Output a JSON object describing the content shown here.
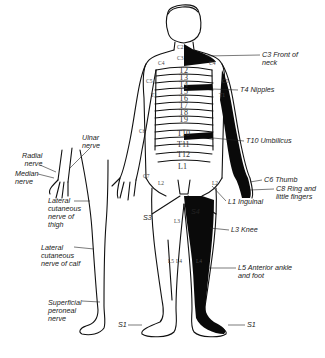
{
  "diagram": {
    "callouts_right": [
      {
        "id": "c3",
        "text": "C3 Front of\nneck",
        "x": 262,
        "y": 52
      },
      {
        "id": "t4",
        "text": "T4 Nipples",
        "x": 240,
        "y": 87
      },
      {
        "id": "t10",
        "text": "T10 Umbilicus",
        "x": 246,
        "y": 138
      },
      {
        "id": "c6",
        "text": "C6 Thumb",
        "x": 264,
        "y": 177
      },
      {
        "id": "c8",
        "text": "C8 Ring and\nlittle fingers",
        "x": 276,
        "y": 186
      },
      {
        "id": "l1",
        "text": "L1 Inguinal",
        "x": 228,
        "y": 199
      },
      {
        "id": "l3",
        "text": "L3 Knee",
        "x": 231,
        "y": 227
      },
      {
        "id": "l5",
        "text": "L5 Anterior ankle\nand foot",
        "x": 238,
        "y": 265
      },
      {
        "id": "s1r",
        "text": "S1",
        "x": 247,
        "y": 322
      }
    ],
    "callouts_left": [
      {
        "id": "radial",
        "text": "Radial\nnerve",
        "x": 22,
        "y": 154
      },
      {
        "id": "median",
        "text": "Median\nnerve",
        "x": 16,
        "y": 171
      },
      {
        "id": "ulnar",
        "text": "Ulnar\nnerve",
        "x": 82,
        "y": 136
      },
      {
        "id": "lcnt",
        "text": "Lateral\ncutaneous\nnerve of\nthigh",
        "x": 48,
        "y": 198
      },
      {
        "id": "lcnc",
        "text": "Lateral\ncutaneous\nnerve of calf",
        "x": 40,
        "y": 245
      },
      {
        "id": "spn",
        "text": "Superficial\nperoneal\nnerve",
        "x": 48,
        "y": 300
      },
      {
        "id": "s1l",
        "text": "S1",
        "x": 120,
        "y": 322
      },
      {
        "id": "s3",
        "text": "S3",
        "x": 143,
        "y": 216
      },
      {
        "id": "s4",
        "text": "S4",
        "x": 190,
        "y": 210
      }
    ],
    "thoracic_levels": [
      "T2",
      "T3",
      "T4",
      "T5",
      "T6",
      "T7",
      "T8",
      "T9",
      "T10",
      "T11",
      "T12",
      "L1"
    ],
    "small_segments": [
      {
        "text": "C2",
        "x": 177,
        "y": 44
      },
      {
        "text": "C3",
        "x": 177,
        "y": 55
      },
      {
        "text": "C4",
        "x": 149,
        "y": 60
      },
      {
        "text": "C4",
        "x": 211,
        "y": 60
      },
      {
        "text": "C5",
        "x": 143,
        "y": 78
      },
      {
        "text": "C5",
        "x": 222,
        "y": 78
      },
      {
        "text": "T1",
        "x": 151,
        "y": 92
      },
      {
        "text": "T1",
        "x": 219,
        "y": 92
      },
      {
        "text": "C6",
        "x": 139,
        "y": 128
      },
      {
        "text": "C7",
        "x": 143,
        "y": 173
      },
      {
        "text": "L2",
        "x": 158,
        "y": 180
      },
      {
        "text": "L2",
        "x": 215,
        "y": 180
      },
      {
        "text": "L3",
        "x": 174,
        "y": 218
      },
      {
        "text": "L5",
        "x": 170,
        "y": 258
      },
      {
        "text": "L4",
        "x": 179,
        "y": 258
      },
      {
        "text": "L4",
        "x": 196,
        "y": 258
      }
    ]
  }
}
